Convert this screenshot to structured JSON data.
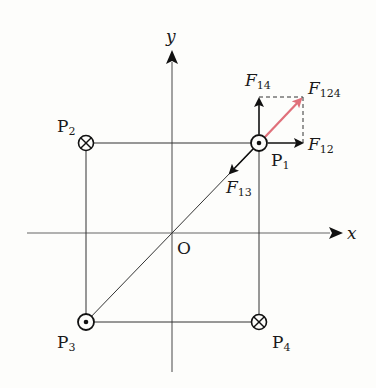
{
  "diagram": {
    "axes": {
      "x_label": "x",
      "y_label": "y",
      "origin_label": "O"
    },
    "points": [
      {
        "id": "P1",
        "label": "P",
        "sub": "1",
        "current": "out-of-page",
        "x": 259,
        "y": 143
      },
      {
        "id": "P2",
        "label": "P",
        "sub": "2",
        "current": "into-page",
        "x": 86,
        "y": 143
      },
      {
        "id": "P3",
        "label": "P",
        "sub": "3",
        "current": "out-of-page",
        "x": 86,
        "y": 322
      },
      {
        "id": "P4",
        "label": "P",
        "sub": "4",
        "current": "into-page",
        "x": 259,
        "y": 322
      }
    ],
    "forces": {
      "F12": {
        "label": "F",
        "sub": "12"
      },
      "F13": {
        "label": "F",
        "sub": "13"
      },
      "F14": {
        "label": "F",
        "sub": "14"
      },
      "F124": {
        "label": "F",
        "sub": "124"
      }
    },
    "colors": {
      "line": "#3a3a3a",
      "axis": "#555555",
      "resultant": "#e0707a",
      "background": "#fdfdfb"
    }
  }
}
